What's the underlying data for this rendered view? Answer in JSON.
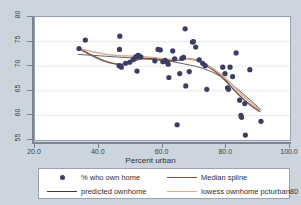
{
  "chart_data": {
    "type": "scatter",
    "title": "",
    "xlabel": "Percent urban",
    "ylabel": "",
    "xlim": [
      20.0,
      100.0
    ],
    "ylim": [
      55,
      80
    ],
    "xticks": [
      "20.0",
      "40.0",
      "60.0",
      "80.0",
      "100.0"
    ],
    "xtick_values": [
      20,
      40,
      60,
      80,
      100
    ],
    "yticks": [
      "55",
      "60",
      "65",
      "70",
      "75",
      "80"
    ],
    "ytick_values": [
      55,
      60,
      65,
      70,
      75,
      80
    ],
    "grid": "horizontal",
    "legend_position": "below-plot",
    "series": [
      {
        "name": "% who own home",
        "type": "scatter",
        "marker": "filled-circle",
        "color": "#3b3d63",
        "points": [
          [
            33.8,
            73.6
          ],
          [
            35.8,
            75.3
          ],
          [
            46.6,
            76.1
          ],
          [
            46.5,
            73.4
          ],
          [
            46.4,
            70.1
          ],
          [
            47.1,
            69.8
          ],
          [
            48.4,
            70.6
          ],
          [
            49.7,
            70.8
          ],
          [
            50.8,
            71.4
          ],
          [
            51.6,
            71.9
          ],
          [
            52.3,
            72.2
          ],
          [
            52.6,
            72.1
          ],
          [
            53.2,
            71.9
          ],
          [
            52.0,
            69.0
          ],
          [
            57.6,
            71.1
          ],
          [
            58.6,
            73.4
          ],
          [
            59.3,
            73.3
          ],
          [
            60.1,
            70.9
          ],
          [
            60.8,
            71.2
          ],
          [
            61.4,
            70.9
          ],
          [
            61.8,
            70.4
          ],
          [
            62.0,
            67.7
          ],
          [
            63.2,
            73.1
          ],
          [
            63.8,
            71.5
          ],
          [
            64.6,
            58.1
          ],
          [
            65.4,
            68.5
          ],
          [
            66.1,
            71.6
          ],
          [
            66.6,
            71.8
          ],
          [
            67.1,
            77.6
          ],
          [
            67.3,
            66.0
          ],
          [
            68.4,
            68.9
          ],
          [
            69.4,
            74.9
          ],
          [
            69.7,
            75.0
          ],
          [
            70.4,
            73.9
          ],
          [
            71.5,
            71.3
          ],
          [
            72.6,
            70.6
          ],
          [
            73.4,
            70.1
          ],
          [
            73.9,
            65.3
          ],
          [
            78.9,
            69.8
          ],
          [
            79.6,
            68.5
          ],
          [
            80.4,
            65.6
          ],
          [
            80.7,
            65.3
          ],
          [
            81.2,
            69.8
          ],
          [
            82.0,
            67.9
          ],
          [
            83.1,
            72.7
          ],
          [
            84.2,
            63.1
          ],
          [
            84.6,
            60.0
          ],
          [
            84.8,
            59.6
          ],
          [
            85.8,
            62.4
          ],
          [
            86.0,
            56.0
          ],
          [
            87.4,
            69.3
          ],
          [
            90.9,
            58.8
          ]
        ]
      },
      {
        "name": "predicted ownhome",
        "type": "line",
        "color": "#3a3a3a",
        "points": [
          [
            33.5,
            72.4
          ],
          [
            50.0,
            71.7
          ],
          [
            64.0,
            71.0
          ],
          [
            76.0,
            69.1
          ],
          [
            84.0,
            65.2
          ],
          [
            91.0,
            61.1
          ]
        ]
      },
      {
        "name": "Median spline",
        "type": "line",
        "color": "#7b5340",
        "points": [
          [
            33.8,
            73.6
          ],
          [
            40.0,
            71.3
          ],
          [
            46.5,
            70.2
          ],
          [
            50.0,
            70.7
          ],
          [
            53.0,
            71.6
          ],
          [
            58.0,
            71.6
          ],
          [
            62.0,
            71.0
          ],
          [
            66.0,
            71.3
          ],
          [
            70.0,
            71.6
          ],
          [
            74.0,
            70.1
          ],
          [
            78.0,
            68.3
          ],
          [
            82.0,
            65.5
          ],
          [
            86.0,
            62.8
          ],
          [
            90.5,
            60.8
          ]
        ]
      },
      {
        "name": "lowess ownhome  pcturban80",
        "type": "line",
        "color": "#d6ad93",
        "points": [
          [
            33.8,
            73.6
          ],
          [
            40.0,
            72.6
          ],
          [
            46.5,
            72.1
          ],
          [
            52.0,
            72.0
          ],
          [
            58.0,
            71.7
          ],
          [
            62.0,
            71.3
          ],
          [
            66.0,
            71.4
          ],
          [
            70.0,
            71.4
          ],
          [
            74.0,
            70.3
          ],
          [
            78.0,
            68.6
          ],
          [
            82.0,
            66.2
          ],
          [
            86.0,
            63.4
          ],
          [
            90.5,
            61.2
          ]
        ]
      }
    ]
  },
  "legend": {
    "entries": [
      {
        "label": "% who own home",
        "key": "marker-dot"
      },
      {
        "label": "Median spline",
        "key": "line-maroon"
      },
      {
        "label": "predicted ownhome",
        "key": "line-dark"
      },
      {
        "label": "lowess ownhome  pcturban80",
        "key": "line-tan"
      }
    ]
  },
  "colors": {
    "background": "#cdd5de",
    "plot_background": "#ffffff",
    "marker": "#3b3d63",
    "median_spline": "#7b5340",
    "lowess": "#d6ad93",
    "predicted": "#3a3a3a",
    "gridline": "#e8ecef",
    "axis": "#7b8490"
  }
}
